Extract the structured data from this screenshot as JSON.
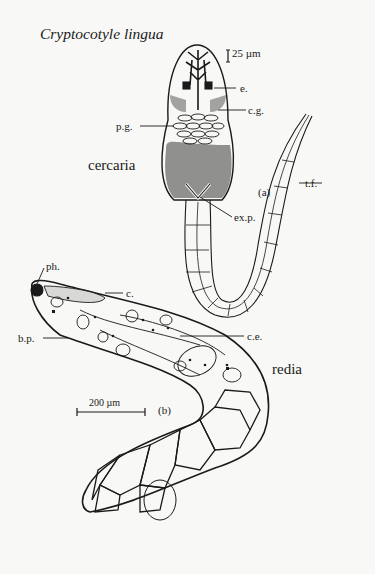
{
  "figure": {
    "title": "Cryptocotyle lingua",
    "panels": [
      {
        "id": "a",
        "panel_label": "(a)",
        "stage_name": "cercaria",
        "scale_bar": "25 µm",
        "labels": {
          "eyespot": "e.",
          "cystogenous_glands": "c.g.",
          "penetration_glands": "p.g.",
          "tail_fin": "t.f.",
          "excretory_pore": "ex.p."
        }
      },
      {
        "id": "b",
        "panel_label": "(b)",
        "stage_name": "redia",
        "scale_bar": "200 µm",
        "labels": {
          "pharynx": "ph.",
          "caecum": "c.",
          "birth_pore": "b.p.",
          "cercarial_embryos": "c.e."
        }
      }
    ]
  }
}
